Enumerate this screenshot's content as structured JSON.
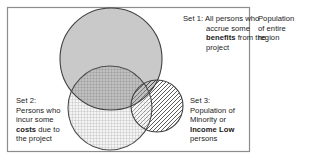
{
  "diagram": {
    "frame": {
      "x": 7,
      "y": 7,
      "width": 243,
      "height": 145,
      "stroke": "#808080",
      "fill": "#ffffff"
    },
    "outer_label": {
      "name": "population-of-entire-region",
      "lines": [
        "Population",
        "of entire",
        "region"
      ],
      "text": "Population\nof entire\nregion"
    },
    "sets": [
      {
        "id": "set1",
        "prefix": "Set 1:",
        "body_before_bold": " All persons who\naccrue some\n",
        "bold": "benefits",
        "body_after_bold": " from the\nproject",
        "plain_text": "Set 1: All persons who accrue some benefits from the project",
        "fill_style": "solid-gray",
        "fill_color": "#c8c8c8",
        "stroke": "#3c3c3c",
        "cx": 111,
        "cy": 59,
        "r": 51
      },
      {
        "id": "set2",
        "prefix": "Set 2:",
        "body_before_bold": "\nPersons who\nincur some\n",
        "bold": "costs",
        "body_after_bold": " due to\nthe project",
        "plain_text": "Set 2: Persons who incur some costs due to the project",
        "fill_style": "grid-hatch",
        "fill_color": "#f2f2f2",
        "stroke": "#4a4a4a",
        "cx": 110,
        "cy": 108,
        "r": 42
      },
      {
        "id": "set3",
        "prefix": "Set 3:",
        "body_before_bold": "\nPopulation of\nMinority or\n",
        "bold": "Income Low",
        "body_after_bold": "\npersons",
        "plain_text": "Set 3: Population of Minority or Income Low persons",
        "fill_style": "diagonal-hatch",
        "fill_color": "#ffffff",
        "stroke": "#3c3c3c",
        "cx": 157,
        "cy": 106,
        "r": 26
      }
    ],
    "colors": {
      "frame_stroke": "#808080",
      "set1_fill": "#c8c8c8",
      "set2_fill": "#f2f2f2",
      "hatch_line": "#555555",
      "text": "#1a1a1a",
      "background": "#ffffff"
    }
  }
}
